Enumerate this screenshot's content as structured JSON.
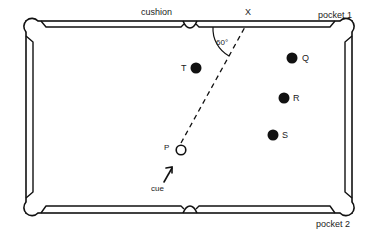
{
  "diagram": {
    "labels": {
      "cushion": "cushion",
      "x_point": "X",
      "pocket1": "pocket 1",
      "pocket2": "pocket 2",
      "angle": "60°",
      "cue": "cue"
    },
    "balls": [
      {
        "id": "T",
        "label": "T",
        "filled": true
      },
      {
        "id": "Q",
        "label": "Q",
        "filled": true
      },
      {
        "id": "R",
        "label": "R",
        "filled": true
      },
      {
        "id": "S",
        "label": "S",
        "filled": true
      },
      {
        "id": "P",
        "label": "P",
        "filled": false
      }
    ],
    "colors": {
      "line": "#111111",
      "ball": "#111111",
      "background": "#ffffff"
    }
  }
}
